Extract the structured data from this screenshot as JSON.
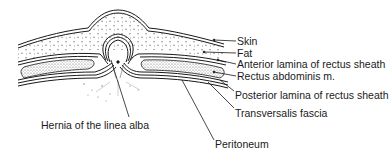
{
  "diagram": {
    "labels": {
      "skin": "Skin",
      "fat": "Fat",
      "anterior_lamina": "Anterior lamina of rectus sheath",
      "rectus": "Rectus abdominis m.",
      "posterior_lamina": "Posterior lamina of rectus sheath",
      "transversalis": "Transversalis fascia",
      "peritoneum": "Peritoneum",
      "hernia": "Hernia of the linea alba"
    },
    "colors": {
      "ink": "#1a1a1a",
      "background": "#ffffff"
    }
  }
}
